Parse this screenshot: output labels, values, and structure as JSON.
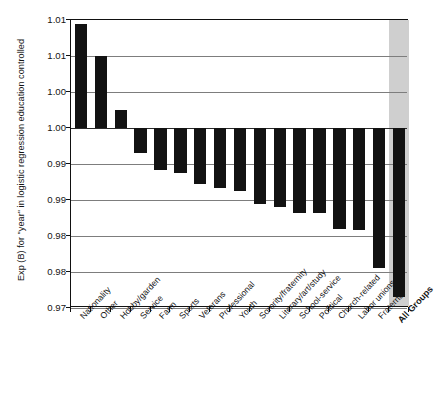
{
  "chart_data": {
    "type": "bar",
    "title": "",
    "subtitle": "",
    "xlabel": "",
    "ylabel": "Exp (B) for \"year\" in logistic regression education controlled",
    "ylim": [
      0.975,
      1.015
    ],
    "ytick_values": [
      1.015,
      1.01,
      1.005,
      1.0,
      0.995,
      0.99,
      0.985,
      0.98,
      0.975
    ],
    "ytick_labels": [
      "1.01",
      "1.01",
      "1.00",
      "1.00",
      "0.99",
      "0.99",
      "0.98",
      "0.98",
      "0.97"
    ],
    "baseline": 1.0,
    "grid": true,
    "legend": "none",
    "highlight_band": {
      "category": "All Groups",
      "color": "#cfcfcf"
    },
    "bar_color": "#121212",
    "categories": [
      "Nationality",
      "Other",
      "Hobby/garden",
      "Service",
      "Farm",
      "Sports",
      "Veterans",
      "Professional",
      "Youth",
      "Sorority/fraternity",
      "Literary/art/study",
      "School-service",
      "Political",
      "Church-related",
      "Labor unions",
      "Fraternal",
      "All Groups"
    ],
    "values": [
      1.0145,
      1.01,
      1.0025,
      0.9965,
      0.9942,
      0.9937,
      0.9922,
      0.9917,
      0.9913,
      0.9895,
      0.989,
      0.9882,
      0.9882,
      0.986,
      0.9858,
      0.9805,
      0.9765
    ]
  }
}
